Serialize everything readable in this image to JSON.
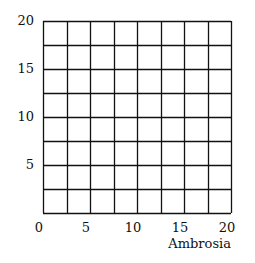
{
  "chart_data": {
    "type": "scatter",
    "title": "",
    "xlabel": "Ambrosia",
    "ylabel": "",
    "xlim": [
      0,
      20
    ],
    "ylim": [
      0,
      20
    ],
    "x_ticks": [
      "0",
      "5",
      "10",
      "15",
      "20"
    ],
    "y_ticks": [
      "5",
      "10",
      "15",
      "20"
    ],
    "grid": true,
    "grid_step": 2.5,
    "grid_divisions": 8,
    "series": [],
    "legend": null
  },
  "colors": {
    "grid": "#111111",
    "background": "#ffffff"
  }
}
